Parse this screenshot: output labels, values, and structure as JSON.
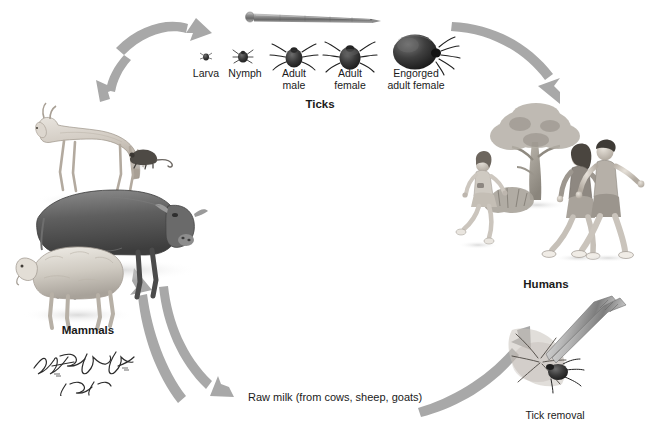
{
  "illustration": {
    "title": "Tick-borne disease transmission cycle",
    "background_color": "#ffffff",
    "arrow_color": "#a6a6a6",
    "label_color": "#1a1a1a"
  },
  "groups": {
    "ticks": {
      "heading": "Ticks",
      "stages": [
        {
          "name": "Larva",
          "label": "Larva",
          "size_px": 4
        },
        {
          "name": "Nymph",
          "label": "Nymph",
          "size_px": 9
        },
        {
          "name": "Adult male",
          "label_line1": "Adult",
          "label_line2": "male",
          "size_px": 15
        },
        {
          "name": "Adult female",
          "label_line1": "Adult",
          "label_line2": "female",
          "size_px": 19
        },
        {
          "name": "Engorged adult female",
          "label_line1": "Engorged",
          "label_line2": "adult female",
          "size_px": 36
        }
      ],
      "scale_reference": "nail"
    },
    "mammals": {
      "heading": "Mammals",
      "animals": [
        "deer",
        "mouse",
        "cow",
        "sheep"
      ]
    },
    "humans": {
      "heading": "Humans",
      "figures": [
        "running-girl",
        "walking-woman",
        "walking-man"
      ],
      "scene": [
        "tree",
        "shrub"
      ]
    },
    "tick_removal": {
      "heading": "Tick removal",
      "tool": "tweezers"
    }
  },
  "pathways": {
    "raw_milk": "Raw milk (from cows, sheep, goats)",
    "arrows": [
      {
        "id": "mammals-ticks",
        "from": "Mammals",
        "to": "Ticks",
        "style": "double-headed"
      },
      {
        "id": "ticks-humans",
        "from": "Ticks",
        "to": "Humans",
        "style": "single"
      },
      {
        "id": "mammals-milk",
        "from": "Mammals",
        "to": "Raw milk",
        "style": "single"
      },
      {
        "id": "milk-humans",
        "from": "Raw milk",
        "to": "Humans",
        "style": "single"
      },
      {
        "id": "ticks-mammals-return",
        "from": "Ticks",
        "to": "Mammals",
        "style": "single"
      }
    ]
  },
  "credits": {
    "signature_1": "F. Netter, M.D.",
    "signature_2": "C. Machado, M.D.",
    "signature_3": "Unpublished"
  }
}
